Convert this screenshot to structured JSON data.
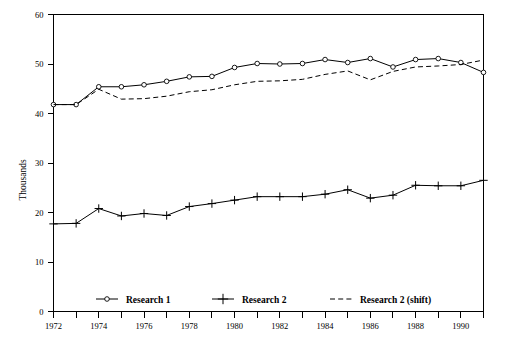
{
  "chart_data": {
    "type": "line",
    "title": "",
    "subtitle": "",
    "xlabel": "",
    "ylabel": "Thousands",
    "xlim": [
      1972,
      1991
    ],
    "ylim": [
      0,
      60
    ],
    "grid": false,
    "legend_position": "bottom-inside",
    "y_ticks": [
      0,
      10,
      20,
      30,
      40,
      50,
      60
    ],
    "y_tick_labels": [
      "0",
      "10",
      "20",
      "30",
      "40",
      "50",
      "60"
    ],
    "x_ticks": [
      1972,
      1973,
      1974,
      1975,
      1976,
      1977,
      1978,
      1979,
      1980,
      1981,
      1982,
      1983,
      1984,
      1985,
      1986,
      1987,
      1988,
      1989,
      1990,
      1991
    ],
    "x_tick_labels_shown": [
      "1972",
      "1974",
      "1976",
      "1978",
      "1980",
      "1982",
      "1984",
      "1986",
      "1988",
      "1990"
    ],
    "x": [
      1972,
      1973,
      1974,
      1975,
      1976,
      1977,
      1978,
      1979,
      1980,
      1981,
      1982,
      1983,
      1984,
      1985,
      1986,
      1987,
      1988,
      1989,
      1990,
      1991
    ],
    "series": [
      {
        "name": "Research 1",
        "marker": "circle-open",
        "line_style": "solid",
        "color": "#000000",
        "values": [
          41.8,
          41.8,
          45.4,
          45.4,
          45.8,
          46.5,
          47.4,
          47.5,
          49.3,
          50.1,
          50.0,
          50.1,
          50.9,
          50.3,
          51.1,
          49.4,
          50.9,
          51.1,
          50.3,
          48.3
        ]
      },
      {
        "name": "Research 2",
        "marker": "plus",
        "line_style": "solid",
        "color": "#000000",
        "values": [
          17.7,
          17.8,
          20.8,
          19.3,
          19.8,
          19.4,
          21.2,
          21.8,
          22.5,
          23.2,
          23.2,
          23.2,
          23.7,
          24.6,
          22.9,
          23.5,
          25.5,
          25.4,
          25.4,
          26.5
        ]
      },
      {
        "name": "Research 2 (shift)",
        "marker": "none",
        "line_style": "dashed",
        "color": "#000000",
        "values": [
          41.8,
          41.8,
          44.9,
          42.9,
          43.0,
          43.5,
          44.4,
          44.8,
          45.8,
          46.5,
          46.6,
          46.9,
          47.9,
          48.6,
          46.8,
          48.5,
          49.4,
          49.6,
          49.9,
          50.8
        ]
      }
    ],
    "legend": [
      {
        "label": "Research 1",
        "marker": "circle-open",
        "line_style": "solid"
      },
      {
        "label": "Research 2",
        "marker": "plus",
        "line_style": "solid"
      },
      {
        "label": "Research 2 (shift)",
        "marker": "none",
        "line_style": "dashed"
      }
    ]
  }
}
